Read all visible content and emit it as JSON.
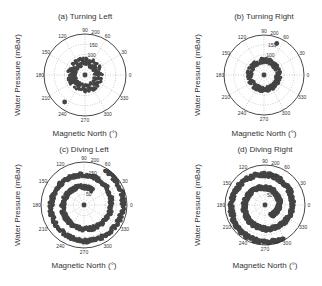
{
  "figure": {
    "y_label": "Water Pressure (mBar)",
    "x_label": "Magnetic North (°)",
    "angle_ticks": [
      "0",
      "30",
      "60",
      "90",
      "120",
      "150",
      "180",
      "210",
      "240",
      "270",
      "300",
      "330"
    ],
    "radial_ticks_top": [
      "100",
      "150",
      "200"
    ],
    "radial_ticks_bottom": [
      "50",
      "150",
      "200"
    ]
  },
  "chart_data": [
    {
      "type": "scatter",
      "subtype": "polar",
      "title": "(a)   Turning Left",
      "xlabel": "Magnetic North (°)",
      "ylabel": "Water Pressure (mBar)",
      "theta_ticks_deg": [
        0,
        30,
        60,
        90,
        120,
        150,
        180,
        210,
        240,
        270,
        300,
        330
      ],
      "r_ticks": [
        50,
        100,
        150,
        200
      ],
      "rlim": [
        0,
        200
      ],
      "grid": true,
      "series": [
        {
          "name": "ring",
          "theta_range_deg": [
            0,
            360
          ],
          "r_range": [
            45,
            85
          ]
        },
        {
          "name": "center",
          "theta_deg": 0,
          "r": 0
        },
        {
          "name": "outlier",
          "theta_deg": 233,
          "r": 165
        }
      ]
    },
    {
      "type": "scatter",
      "subtype": "polar",
      "title": "(b)   Turning Right",
      "xlabel": "Magnetic North (°)",
      "ylabel": "Water Pressure (mBar)",
      "theta_ticks_deg": [
        0,
        30,
        60,
        90,
        120,
        150,
        180,
        210,
        240,
        270,
        300,
        330
      ],
      "r_ticks": [
        50,
        100,
        150,
        200
      ],
      "rlim": [
        0,
        200
      ],
      "grid": true,
      "series": [
        {
          "name": "ring",
          "theta_range_deg": [
            0,
            360
          ],
          "r_range": [
            60,
            85
          ]
        },
        {
          "name": "center",
          "theta_deg": 0,
          "r": 0
        },
        {
          "name": "outlier",
          "theta_deg": 68,
          "r": 170
        }
      ]
    },
    {
      "type": "scatter",
      "subtype": "polar",
      "title": "(c)   Diving Left",
      "xlabel": "Magnetic North (°)",
      "ylabel": "Water Pressure (mBar)",
      "theta_ticks_deg": [
        0,
        30,
        60,
        90,
        120,
        150,
        180,
        210,
        240,
        270,
        300,
        330
      ],
      "r_ticks": [
        50,
        100,
        150,
        200
      ],
      "rlim": [
        0,
        200
      ],
      "grid": true,
      "series": [
        {
          "name": "spiral",
          "theta_range_deg": [
            60,
            780
          ],
          "r_range": [
            80,
            190
          ]
        },
        {
          "name": "center",
          "theta_deg": 0,
          "r": 0
        }
      ]
    },
    {
      "type": "scatter",
      "subtype": "polar",
      "title": "(d)   Diving Right",
      "xlabel": "Magnetic North (°)",
      "ylabel": "Water Pressure (mBar)",
      "theta_ticks_deg": [
        0,
        30,
        60,
        90,
        120,
        150,
        180,
        210,
        240,
        270,
        300,
        330
      ],
      "r_ticks": [
        50,
        100,
        150,
        200
      ],
      "rlim": [
        0,
        200
      ],
      "grid": true,
      "series": [
        {
          "name": "spiral",
          "theta_range_deg": [
            -60,
            660
          ],
          "r_range": [
            60,
            190
          ]
        },
        {
          "name": "center",
          "theta_deg": 0,
          "r": 0
        }
      ]
    }
  ]
}
